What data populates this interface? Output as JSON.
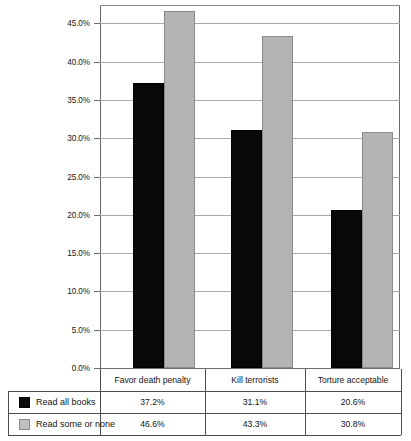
{
  "chart_data": {
    "type": "bar",
    "title": "",
    "xlabel": "",
    "ylabel": "",
    "categories": [
      "Favor death penalty",
      "Kill terrorists",
      "Torture acceptable"
    ],
    "series": [
      {
        "name": "Read all books",
        "color": "#080808",
        "values": [
          37.2,
          31.1,
          20.6
        ],
        "labels": [
          "37.2%",
          "31.1%",
          "20.6%"
        ]
      },
      {
        "name": "Read some or none",
        "color": "#b4b4b4",
        "values": [
          46.6,
          43.3,
          30.8
        ],
        "labels": [
          "46.6%",
          "43.3%",
          "30.8%"
        ]
      }
    ],
    "ylim": [
      0,
      47.4
    ],
    "yticks": [
      0,
      5,
      10,
      15,
      20,
      25,
      30,
      35,
      40,
      45
    ],
    "ytick_labels": [
      "0.0%",
      "5.0%",
      "10.0%",
      "15.0%",
      "20.0%",
      "25.0%",
      "30.0%",
      "35.0%",
      "40.0%",
      "45.0%"
    ],
    "grid": true,
    "legend_position": "bottom-table"
  },
  "table": {
    "row_header_blank": "",
    "column_headers": [
      "Favor death penalty",
      "Kill terrorists",
      "Torture acceptable"
    ],
    "rows": [
      {
        "label": "Read all books",
        "swatch": "black-swatch-icon",
        "cells": [
          "37.2%",
          "31.1%",
          "20.6%"
        ]
      },
      {
        "label": "Read some or none",
        "swatch": "grey-swatch-icon",
        "cells": [
          "46.6%",
          "43.3%",
          "30.8%"
        ]
      }
    ]
  }
}
